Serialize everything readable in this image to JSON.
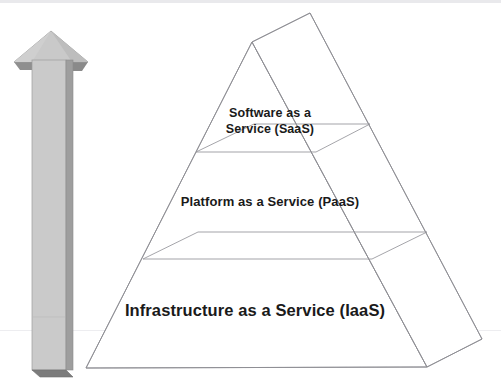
{
  "diagram": {
    "type": "3d-pyramid",
    "direction_arrow": {
      "name": "upward-arrow",
      "orientation": "up",
      "fill_color": "#c9c9c9",
      "shade_color": "#9a9a9a",
      "edge_color": "#7d7d7d"
    },
    "layers": [
      {
        "id": "saas",
        "label": "Software as a\nService (SaaS)",
        "level": 3,
        "position": "top",
        "font_size_px": 12.5
      },
      {
        "id": "paas",
        "label": "Platform as a Service (PaaS)",
        "level": 2,
        "position": "middle",
        "font_size_px": 13
      },
      {
        "id": "iaas",
        "label": "Infrastructure as a Service (IaaS)",
        "level": 1,
        "position": "bottom",
        "font_size_px": 16.5
      }
    ],
    "colors": {
      "outline": "#8d8d93",
      "outline_light": "#a8a8ad",
      "text": "#1a1a1a",
      "background": "#ffffff",
      "band": "#ededf0"
    }
  }
}
